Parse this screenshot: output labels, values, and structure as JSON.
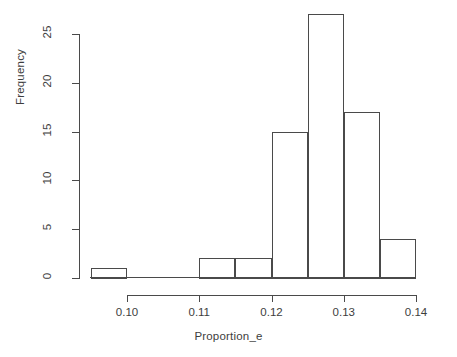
{
  "chart_data": {
    "type": "bar",
    "title": "",
    "subtitle": "",
    "xlabel": "Proportion_e",
    "ylabel": "Frequency",
    "grid": false,
    "legend": null,
    "xlim": [
      0.0955,
      0.1405
    ],
    "ylim": [
      0,
      27
    ],
    "x_ticks": [
      0.1,
      0.11,
      0.12,
      0.13,
      0.14
    ],
    "x_tick_labels": [
      "0.10",
      "0.11",
      "0.12",
      "0.13",
      "0.14"
    ],
    "y_ticks": [
      0,
      5,
      10,
      15,
      20,
      25
    ],
    "y_tick_labels": [
      "0",
      "5",
      "10",
      "15",
      "20",
      "25"
    ],
    "bin_width": 0.005,
    "bin_edges": [
      0.095,
      0.1,
      0.105,
      0.11,
      0.115,
      0.12,
      0.125,
      0.13,
      0.135,
      0.14
    ],
    "categories": [
      "0.095-0.100",
      "0.100-0.105",
      "0.105-0.110",
      "0.110-0.115",
      "0.115-0.120",
      "0.120-0.125",
      "0.125-0.130",
      "0.130-0.135",
      "0.135-0.140"
    ],
    "values": [
      1,
      0,
      0,
      2,
      2,
      15,
      27,
      17,
      4
    ],
    "bars": [
      {
        "label": "bin-0.095-0.100",
        "left": 0.095,
        "right": 0.1,
        "value": 1
      },
      {
        "label": "bin-0.110-0.115",
        "left": 0.11,
        "right": 0.115,
        "value": 2
      },
      {
        "label": "bin-0.115-0.120",
        "left": 0.115,
        "right": 0.12,
        "value": 2
      },
      {
        "label": "bin-0.120-0.125",
        "left": 0.12,
        "right": 0.125,
        "value": 15
      },
      {
        "label": "bin-0.125-0.130",
        "left": 0.125,
        "right": 0.13,
        "value": 27
      },
      {
        "label": "bin-0.130-0.135",
        "left": 0.13,
        "right": 0.135,
        "value": 17
      },
      {
        "label": "bin-0.135-0.140",
        "left": 0.135,
        "right": 0.14,
        "value": 4
      }
    ],
    "colors": {
      "bar_outline": "#4a4a4a",
      "bar_fill": "#ffffff",
      "axis": "#4a4a4a",
      "text": "#3d3d3d",
      "background": "#ffffff"
    }
  }
}
